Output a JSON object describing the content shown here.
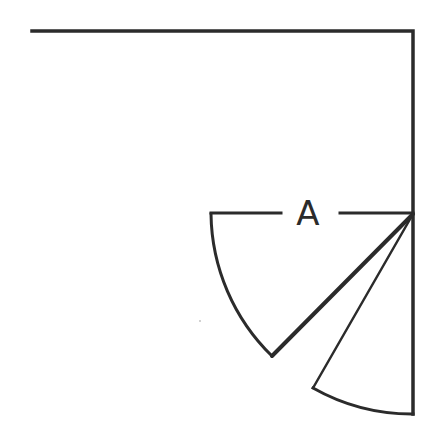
{
  "diagram": {
    "type": "door-swing-plan",
    "canvas": {
      "width": 431,
      "height": 439,
      "background": "#ffffff"
    },
    "stroke_color": "#2b2b2b",
    "label": {
      "text": "A",
      "x": 308,
      "y": 225,
      "font_size": 34
    },
    "walls": [
      {
        "name": "top-wall",
        "x1": 32,
        "y1": 31,
        "x2": 413,
        "y2": 31
      },
      {
        "name": "right-wall",
        "x1": 413,
        "y1": 31,
        "x2": 413,
        "y2": 414
      }
    ],
    "dimension_line": {
      "left_segment": {
        "x1": 211,
        "y1": 213,
        "x2": 281,
        "y2": 213
      },
      "right_segment": {
        "x1": 340,
        "y1": 213,
        "x2": 413,
        "y2": 213
      }
    },
    "pivot": {
      "x": 413,
      "y": 214
    },
    "swings": [
      {
        "name": "door-swing-1",
        "arc_start": {
          "x": 211,
          "y": 214
        },
        "arc_end": {
          "x": 272,
          "y": 356
        },
        "radius": 202,
        "leaf_width": 4
      },
      {
        "name": "door-swing-2",
        "arc_start": {
          "x": 313,
          "y": 388
        },
        "arc_end": {
          "x": 413,
          "y": 414
        },
        "radius": 201,
        "leaf_width": 2.5
      }
    ],
    "speck": {
      "x": 200,
      "y": 321,
      "r": 0.8
    }
  }
}
